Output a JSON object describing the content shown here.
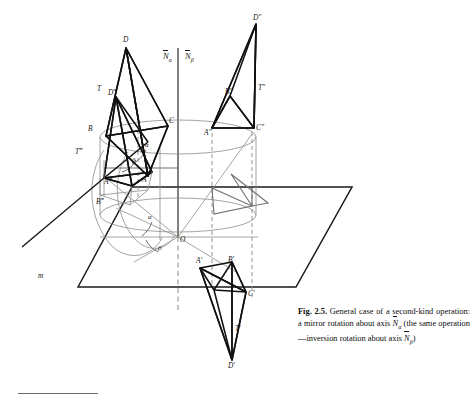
{
  "figure": {
    "number": "Fig. 2.5.",
    "caption_text": " General case of a second-kind operation: a mirror rotation about axis ",
    "caption_mid": " (the same operation—inversion rotation about axis ",
    "caption_end": ")",
    "axis_alpha_symbol": "N",
    "axis_alpha_sub": "α",
    "axis_beta_symbol": "N",
    "axis_beta_sub": "β"
  },
  "axes": {
    "alpha_label": "N",
    "alpha_sub": "α",
    "beta_label": "N",
    "beta_sub": "β"
  },
  "labels": {
    "plane_mirror": "m",
    "origin": "O",
    "angle_alpha_upper": "α",
    "angle_beta_upper": "β",
    "angle_alpha_lower": "α",
    "angle_beta_lower": "β",
    "orig_D": "D",
    "orig_T": "T",
    "orig_B": "B",
    "orig_C": "C",
    "orig_A": "A",
    "tri3_D": "D‴",
    "tri3_T": "T‴",
    "tri3_B": "B‴",
    "tri3_A": "A‴",
    "tri2_D": "D″",
    "tri2_T": "T″",
    "tri2_B": "B″",
    "tri2_A": "A″",
    "tri2_C": "C″",
    "tri1_A": "A′",
    "tri1_B": "B′",
    "tri1_C": "C′",
    "tri1_T": "T′",
    "tri1_D": "D′"
  },
  "colors": {
    "ink": "#1a1a1a",
    "thin": "#6f6f6f",
    "dashed": "#8a8a8a",
    "background": "#ffffff"
  },
  "geometry": {
    "plane_polygon": "78,287 132,187 352,187 296,287",
    "axis_x": 178,
    "axis_top_y": 48,
    "axis_bottom_y": 312,
    "origin": [
      178,
      237
    ]
  }
}
